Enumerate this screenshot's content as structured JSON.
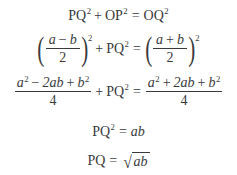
{
  "document": {
    "type": "math-derivation",
    "background_color": "#ffffff",
    "text_color": "#3a3a3c",
    "lines": [
      {
        "id": "line-1",
        "plain": "PQ^2 + OP^2 = OQ^2",
        "terms": {
          "lhs_a_base": "PQ",
          "lhs_a_exp": "2",
          "plus": "+",
          "lhs_b_base": "OP",
          "lhs_b_exp": "2",
          "equals": "=",
          "rhs_base": "OQ",
          "rhs_exp": "2"
        }
      },
      {
        "id": "line-2",
        "plain": "((a - b)/2)^2 + PQ^2 = ((a + b)/2)^2",
        "terms": {
          "left_paren": "(",
          "right_paren": ")",
          "lhs_num_a": "a",
          "lhs_num_op": "−",
          "lhs_num_b": "b",
          "lhs_den": "2",
          "lhs_group_exp": "2",
          "plus": "+",
          "pq_base": "PQ",
          "pq_exp": "2",
          "equals": "=",
          "rhs_num_a": "a",
          "rhs_num_op": "+",
          "rhs_num_b": "b",
          "rhs_den": "2",
          "rhs_group_exp": "2"
        }
      },
      {
        "id": "line-3",
        "plain": "(a^2 - 2ab + b^2)/4 + PQ^2 = (a^2 + 2ab + b^2)/4",
        "terms": {
          "lhs_num_a": "a",
          "lhs_num_a_exp": "2",
          "lhs_num_op1": "−",
          "lhs_num_mid": "2ab",
          "lhs_num_op2": "+",
          "lhs_num_b": "b",
          "lhs_num_b_exp": "2",
          "lhs_den": "4",
          "plus": "+",
          "pq_base": "PQ",
          "pq_exp": "2",
          "equals": "=",
          "rhs_num_a": "a",
          "rhs_num_a_exp": "2",
          "rhs_num_op1": "+",
          "rhs_num_mid": "2ab",
          "rhs_num_op2": "+",
          "rhs_num_b": "b",
          "rhs_num_b_exp": "2",
          "rhs_den": "4"
        }
      },
      {
        "id": "line-4",
        "plain": "PQ^2 = ab",
        "terms": {
          "lhs_base": "PQ",
          "lhs_exp": "2",
          "equals": "=",
          "rhs": "ab"
        }
      },
      {
        "id": "line-5",
        "plain": "PQ = sqrt(ab)",
        "terms": {
          "lhs": "PQ",
          "equals": "=",
          "radical": "√",
          "radicand": "ab"
        }
      }
    ]
  }
}
